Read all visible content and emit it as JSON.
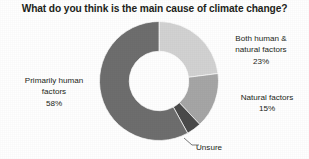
{
  "chart_data": {
    "type": "pie",
    "variant": "donut",
    "title": "What do you think is the main cause of climate change?",
    "xlabel": "",
    "ylabel": "",
    "grid": false,
    "legend_position": "none",
    "labels_position": "outside-callout",
    "start_angle_deg": 0,
    "direction": "clockwise",
    "inner_radius_ratio": 0.5,
    "categories": [
      "Both human & natural factors",
      "Natural factors",
      "Unsure",
      "Primarily human factors"
    ],
    "values": [
      23,
      15,
      4,
      58
    ],
    "value_suffix": "%",
    "colors": [
      "#d2d2d2",
      "#a6a6a6",
      "#4a4a4a",
      "#6e6e6e"
    ],
    "slices": [
      {
        "name": "Both human & natural factors",
        "value": 23,
        "display_value": "23%",
        "color": "#d2d2d2",
        "label_lines": [
          "Both human &",
          "natural factors",
          "23%"
        ]
      },
      {
        "name": "Natural factors",
        "value": 15,
        "display_value": "15%",
        "color": "#a6a6a6",
        "label_lines": [
          "Natural factors",
          "15%"
        ]
      },
      {
        "name": "Unsure",
        "value": 4,
        "display_value": "",
        "color": "#4a4a4a",
        "label_lines": [
          "Unsure"
        ]
      },
      {
        "name": "Primarily human factors",
        "value": 58,
        "display_value": "58%",
        "color": "#6e6e6e",
        "label_lines": [
          "Primarily human",
          "factors",
          "58%"
        ]
      }
    ]
  },
  "labels": {
    "both": {
      "line1": "Both human &",
      "line2": "natural factors",
      "line3": "23%"
    },
    "natural": {
      "line1": "Natural factors",
      "line2": "15%"
    },
    "primarily": {
      "line1": "Primarily human",
      "line2": "factors",
      "line3": "58%"
    },
    "unsure": {
      "line1": "Unsure"
    }
  }
}
